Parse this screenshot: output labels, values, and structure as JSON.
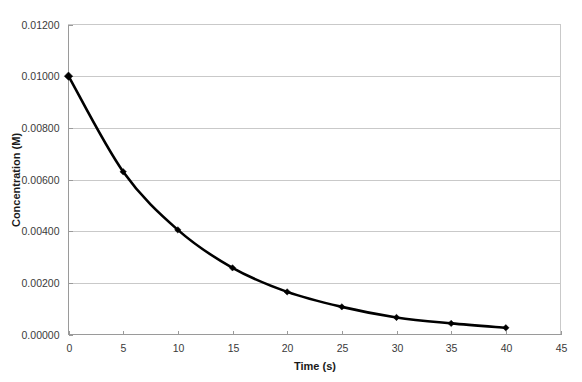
{
  "chart_data": {
    "type": "line",
    "title": "",
    "xlabel": "Time (s)",
    "ylabel": "Concentration (M)",
    "xlim": [
      0,
      45
    ],
    "ylim": [
      0,
      0.012
    ],
    "grid": true,
    "legend": false,
    "x": [
      0,
      5,
      10,
      15,
      20,
      25,
      30,
      35,
      40
    ],
    "values": [
      0.01,
      0.0063,
      0.00405,
      0.00258,
      0.00165,
      0.00107,
      0.00066,
      0.00043,
      0.00026
    ],
    "series": [
      {
        "name": "Concentration",
        "values": [
          0.01,
          0.0063,
          0.00405,
          0.00258,
          0.00165,
          0.00107,
          0.00066,
          0.00043,
          0.00026
        ],
        "color": "#000000",
        "marker": "diamond"
      }
    ],
    "xticks": [
      0,
      5,
      10,
      15,
      20,
      25,
      30,
      35,
      40,
      45
    ],
    "xtick_labels": [
      "0",
      "5",
      "10",
      "15",
      "20",
      "25",
      "30",
      "35",
      "40",
      "45"
    ],
    "yticks": [
      0,
      0.002,
      0.004,
      0.006,
      0.008,
      0.01,
      0.012
    ],
    "ytick_labels": [
      "0.00000",
      "0.00200",
      "0.00400",
      "0.00600",
      "0.00800",
      "0.01000",
      "0.01200"
    ],
    "gridline_color": "#c9c9c9",
    "axis_color": "#9a9a9a",
    "background_color": "#ffffff"
  }
}
